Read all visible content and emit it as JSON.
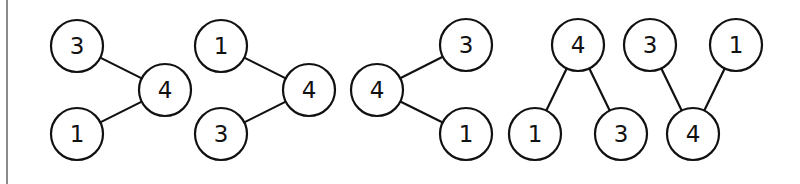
{
  "diagram": {
    "stroke_color": "#111111",
    "node_radius": 26,
    "graphs": [
      {
        "name": "graph-1",
        "nodes": [
          {
            "id": "g1n3",
            "label": "3",
            "x": 77,
            "y": 46
          },
          {
            "id": "g1n4",
            "label": "4",
            "x": 165,
            "y": 90
          },
          {
            "id": "g1n1",
            "label": "1",
            "x": 77,
            "y": 134
          }
        ],
        "edges": [
          [
            "g1n3",
            "g1n4"
          ],
          [
            "g1n1",
            "g1n4"
          ]
        ]
      },
      {
        "name": "graph-2",
        "nodes": [
          {
            "id": "g2n1",
            "label": "1",
            "x": 221,
            "y": 46
          },
          {
            "id": "g2n4",
            "label": "4",
            "x": 309,
            "y": 90
          },
          {
            "id": "g2n3",
            "label": "3",
            "x": 221,
            "y": 134
          }
        ],
        "edges": [
          [
            "g2n1",
            "g2n4"
          ],
          [
            "g2n3",
            "g2n4"
          ]
        ]
      },
      {
        "name": "graph-3",
        "nodes": [
          {
            "id": "g3n4",
            "label": "4",
            "x": 377,
            "y": 90
          },
          {
            "id": "g3n3",
            "label": "3",
            "x": 466,
            "y": 45
          },
          {
            "id": "g3n1",
            "label": "1",
            "x": 466,
            "y": 134
          }
        ],
        "edges": [
          [
            "g3n4",
            "g3n3"
          ],
          [
            "g3n4",
            "g3n1"
          ]
        ]
      },
      {
        "name": "graph-4",
        "nodes": [
          {
            "id": "g4n4",
            "label": "4",
            "x": 578,
            "y": 45
          },
          {
            "id": "g4n1",
            "label": "1",
            "x": 535,
            "y": 134
          },
          {
            "id": "g4n3",
            "label": "3",
            "x": 621,
            "y": 134
          }
        ],
        "edges": [
          [
            "g4n4",
            "g4n1"
          ],
          [
            "g4n4",
            "g4n3"
          ]
        ]
      },
      {
        "name": "graph-5",
        "nodes": [
          {
            "id": "g5n3",
            "label": "3",
            "x": 650,
            "y": 45
          },
          {
            "id": "g5n1",
            "label": "1",
            "x": 736,
            "y": 45
          },
          {
            "id": "g5n4",
            "label": "4",
            "x": 693,
            "y": 134
          }
        ],
        "edges": [
          [
            "g5n3",
            "g5n4"
          ],
          [
            "g5n1",
            "g5n4"
          ]
        ]
      }
    ]
  }
}
